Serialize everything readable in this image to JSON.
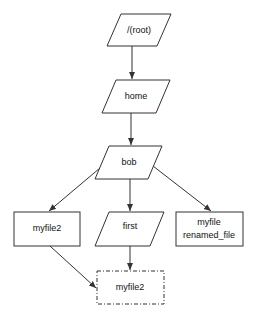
{
  "diagram": {
    "type": "tree",
    "nodes": [
      {
        "id": "root",
        "label": "/(root)",
        "shape": "parallelogram"
      },
      {
        "id": "home",
        "label": "home",
        "shape": "parallelogram"
      },
      {
        "id": "bob",
        "label": "bob",
        "shape": "parallelogram"
      },
      {
        "id": "myfile2",
        "label": "myfile2",
        "shape": "rectangle"
      },
      {
        "id": "first",
        "label": "first",
        "shape": "parallelogram"
      },
      {
        "id": "renamed",
        "label_line1": "myfile",
        "label_line2": "renamed_file",
        "shape": "rectangle"
      },
      {
        "id": "myfile2_moved",
        "label": "myfile2",
        "shape": "dashed-rectangle"
      }
    ],
    "edges": [
      {
        "from": "root",
        "to": "home"
      },
      {
        "from": "home",
        "to": "bob"
      },
      {
        "from": "bob",
        "to": "myfile2"
      },
      {
        "from": "bob",
        "to": "first"
      },
      {
        "from": "bob",
        "to": "renamed"
      },
      {
        "from": "myfile2",
        "to": "myfile2_moved"
      },
      {
        "from": "first",
        "to": "myfile2_moved"
      }
    ],
    "colors": {
      "stroke": "#333333",
      "fill": "#ffffff",
      "text": "#111111"
    }
  }
}
